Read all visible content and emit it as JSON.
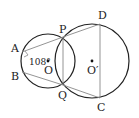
{
  "diagram": {
    "type": "geometry",
    "circles": [
      {
        "name": "O",
        "center_label": "O"
      },
      {
        "name": "O'",
        "center_label": "O′"
      }
    ],
    "points": {
      "A": "A",
      "B": "B",
      "P": "P",
      "Q": "Q",
      "C": "C",
      "D": "D",
      "O": "O",
      "O2": "O′"
    },
    "angle_label": "108°",
    "segments": [
      "AP",
      "BQ",
      "PQ",
      "DC",
      "PD",
      "QC",
      "AB"
    ],
    "colors": {
      "circle": "#222222",
      "line": "#888888"
    }
  }
}
